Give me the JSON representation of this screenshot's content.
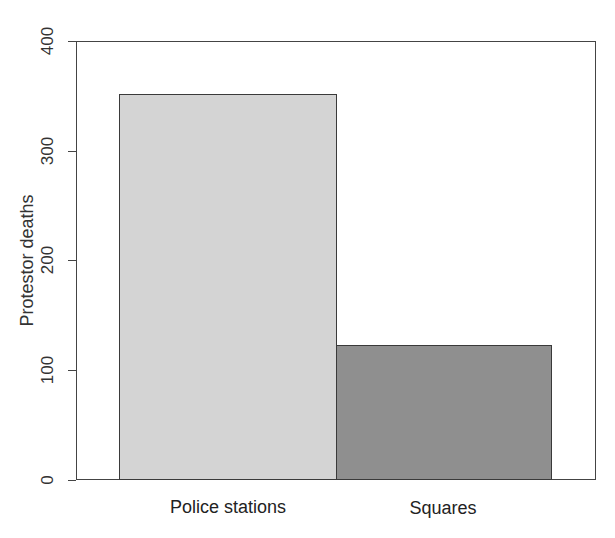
{
  "chart_data": {
    "type": "bar",
    "title": "",
    "xlabel": "",
    "ylabel": "Protestor deaths",
    "categories": [
      "Police stations",
      "Squares"
    ],
    "values": [
      352,
      123
    ],
    "bar_colors": [
      "#d4d4d4",
      "#8f8f8f"
    ],
    "ylim": [
      0,
      400
    ],
    "yticks": [
      0,
      100,
      200,
      300,
      400
    ],
    "ytick_labels": [
      "0",
      "100",
      "200",
      "300",
      "400"
    ],
    "grid": false,
    "legend": null
  },
  "axes": {
    "ylabel": "Protestor deaths",
    "ytick_labels": [
      "0",
      "100",
      "200",
      "300",
      "400"
    ],
    "xtick_labels": [
      "Police stations",
      "Squares"
    ]
  }
}
